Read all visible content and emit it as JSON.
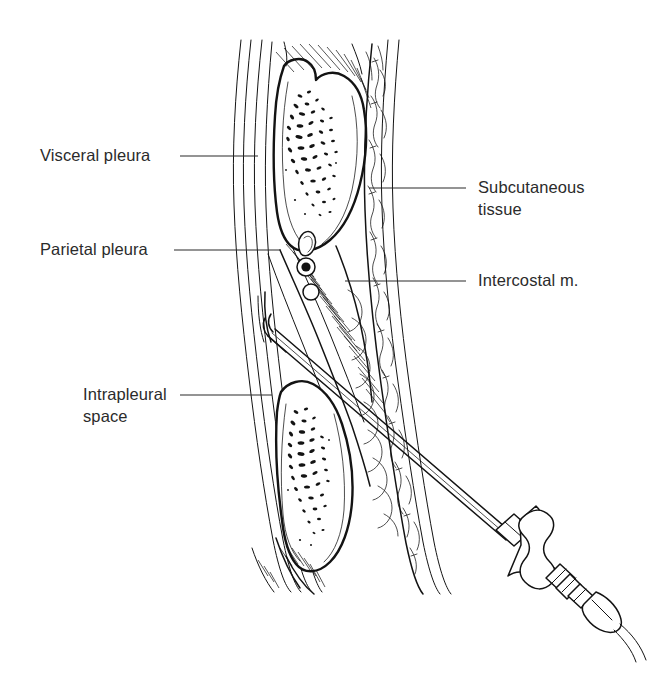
{
  "figure": {
    "kind": "anatomical-line-drawing",
    "background_color": "#ffffff",
    "ink_color": "#131313",
    "text_color": "#2b2b2b"
  },
  "labels": [
    {
      "id": "visceral-pleura",
      "lines": [
        "Visceral pleura"
      ],
      "side": "left",
      "text_x": 40,
      "text_y": 161,
      "leader": {
        "x1": 180,
        "y1": 156,
        "x2": 258,
        "y2": 156
      }
    },
    {
      "id": "parietal-pleura",
      "lines": [
        "Parietal pleura"
      ],
      "side": "left",
      "text_x": 40,
      "text_y": 255,
      "leader": {
        "x1": 174,
        "y1": 250,
        "x2": 281,
        "y2": 250
      }
    },
    {
      "id": "intrapleural-space",
      "lines": [
        "Intrapleural",
        "space"
      ],
      "side": "left",
      "text_x": 83,
      "text_y": 400,
      "leader": {
        "x1": 180,
        "y1": 395,
        "x2": 272,
        "y2": 395
      }
    },
    {
      "id": "subcutaneous-tissue",
      "lines": [
        "Subcutaneous",
        "tissue"
      ],
      "side": "right",
      "text_x": 478,
      "text_y": 193,
      "leader": {
        "x1": 369,
        "y1": 188,
        "x2": 466,
        "y2": 188
      }
    },
    {
      "id": "intercostal-muscle",
      "lines": [
        "Intercostal m."
      ],
      "side": "right",
      "text_x": 478,
      "text_y": 286,
      "leader": {
        "x1": 345,
        "y1": 281,
        "x2": 466,
        "y2": 281
      }
    }
  ],
  "structures": [
    {
      "id": "skin-surface",
      "name": "Skin surface"
    },
    {
      "id": "subcutaneous-layer",
      "name": "Subcutaneous fat layer"
    },
    {
      "id": "intercostal-muscle",
      "name": "Intercostal muscle"
    },
    {
      "id": "rib-upper",
      "name": "Upper rib, cancellous bone"
    },
    {
      "id": "rib-lower",
      "name": "Lower rib, cancellous bone"
    },
    {
      "id": "neurovascular-bundle",
      "name": "Intercostal vein, artery and nerve"
    },
    {
      "id": "parietal-pleura-line",
      "name": "Parietal pleura"
    },
    {
      "id": "intrapleural-space",
      "name": "Intrapleural space"
    },
    {
      "id": "visceral-pleura-line",
      "name": "Visceral pleura"
    },
    {
      "id": "lung-surface",
      "name": "Lung surface"
    }
  ],
  "instrument": {
    "id": "thoracentesis-trocar",
    "name": "Thoracentesis needle and trocar",
    "parts": [
      {
        "id": "needle-tip",
        "name": "Needle tip in intrapleural space"
      },
      {
        "id": "needle-shaft",
        "name": "Needle shaft"
      },
      {
        "id": "handle-collar",
        "name": "Proximal collar"
      },
      {
        "id": "handle-grip",
        "name": "Hourglass handle grip"
      },
      {
        "id": "handle-flange",
        "name": "Distal flange"
      },
      {
        "id": "hub",
        "name": "Connector hub"
      },
      {
        "id": "tubing",
        "name": "Drainage tubing"
      }
    ]
  }
}
